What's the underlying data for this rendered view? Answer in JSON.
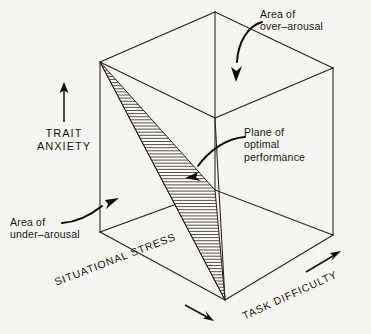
{
  "figure": {
    "background_color": "#f5f5f3",
    "line_color": "#24211f"
  },
  "axes": {
    "vertical": {
      "name": "trait-anxiety-axis",
      "label": "TRAIT\nANXIETY",
      "label_line_1": "TRAIT",
      "label_line_2": "ANXIETY",
      "direction": "up",
      "arrow": "↑"
    },
    "depth_left": {
      "name": "situational-stress-axis",
      "label": "SITUATIONAL STRESS",
      "direction": "down-right",
      "arrow": "→"
    },
    "depth_right": {
      "name": "task-difficulty-axis",
      "label": "TASK DIFFICULTY",
      "direction": "up-right",
      "arrow": "→"
    }
  },
  "annotations": [
    {
      "id": "over-arousal",
      "line_1": "Area of",
      "line_2": "over–arousal",
      "text": "Area of over-arousal",
      "pointer": "curved-arrow-down-left"
    },
    {
      "id": "under-arousal",
      "line_1": "Area of",
      "line_2": "under–arousal",
      "text": "Area of under-arousal",
      "pointer": "curved-arrow-up-right"
    },
    {
      "id": "plane-optimal-performance",
      "line_1": "Plane of",
      "line_2": "optimal",
      "line_3": "performance",
      "text": "Plane of optimal performance",
      "pointer": "curved-arrow-down-left"
    }
  ],
  "chart_data": {
    "type": "diagram",
    "subtype": "3d-cube-schematic",
    "dimensions": [
      {
        "axis": "y",
        "label": "TRAIT ANXIETY",
        "direction": "increasing upward"
      },
      {
        "axis": "x-left",
        "label": "SITUATIONAL STRESS",
        "direction": "increasing toward front-right"
      },
      {
        "axis": "x-right",
        "label": "TASK DIFFICULTY",
        "direction": "increasing toward upper-right"
      }
    ],
    "regions": [
      {
        "name": "Area of over-arousal",
        "location": "upper region of cube"
      },
      {
        "name": "Area of under-arousal",
        "location": "lower-left region of cube"
      },
      {
        "name": "Plane of optimal performance",
        "location": "hatched diagonal wedge",
        "fill": "horizontal hatching"
      }
    ],
    "cube_vertices": {
      "top_back": [
        215,
        12
      ],
      "top_left_front": [
        100,
        62
      ],
      "top_right": [
        333,
        68
      ],
      "top_right_front_hidden": [
        215,
        118
      ],
      "bottom_left_front": [
        100,
        232
      ],
      "bottom_front": [
        225,
        300
      ],
      "bottom_right": [
        333,
        235
      ],
      "bottom_back_hidden": [
        215,
        190
      ]
    },
    "plane_vertices": {
      "apex": [
        100,
        62
      ],
      "mid": [
        215,
        190
      ],
      "base": [
        225,
        300
      ]
    },
    "grid": false,
    "legend": false
  }
}
